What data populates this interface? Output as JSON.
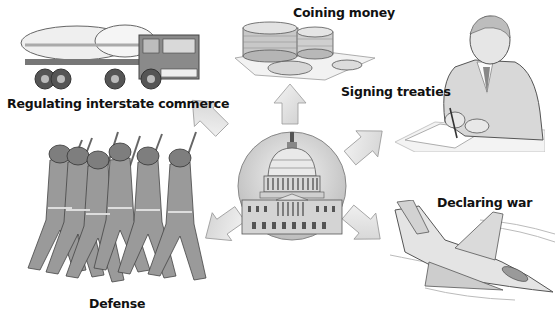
{
  "diagram": {
    "center": {
      "name": "United States Capitol",
      "icon": "capitol-building-icon"
    },
    "powers": [
      {
        "id": "regulating-commerce",
        "label": "Regulating interstate commerce",
        "icon": "tanker-truck-icon",
        "arrow_direction": "up-left"
      },
      {
        "id": "coining-money",
        "label": "Coining money",
        "icon": "coins-icon",
        "arrow_direction": "up"
      },
      {
        "id": "signing-treaties",
        "label": "Signing treaties",
        "icon": "man-signing-document-icon",
        "arrow_direction": "up-right"
      },
      {
        "id": "declaring-war",
        "label": "Declaring war",
        "icon": "fighter-jet-icon",
        "arrow_direction": "down-right"
      },
      {
        "id": "defense",
        "label": "Defense",
        "icon": "marching-soldiers-icon",
        "arrow_direction": "down-left"
      }
    ],
    "colors": {
      "arrow_fill": "#e6e6e6",
      "arrow_stroke": "#9a9a9a",
      "ink": "#333333",
      "background": "#ffffff"
    }
  }
}
